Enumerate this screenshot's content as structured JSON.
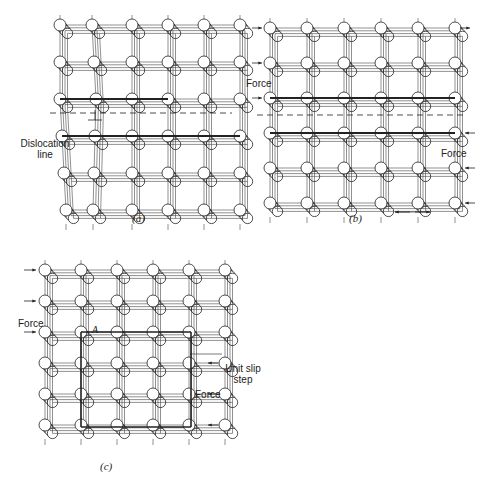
{
  "figure": {
    "panels": [
      {
        "id": "a",
        "caption": "(a)",
        "labels": {
          "dislocation": "Dislocation line"
        },
        "grid": {
          "cols": 6,
          "rows": 6,
          "origin": [
            60,
            25
          ],
          "dx": 36,
          "dy": 37
        }
      },
      {
        "id": "b",
        "caption": "(b)",
        "labels": {
          "force_left": "Force",
          "force_right": "Force",
          "dislocation_symbol": "⊥"
        },
        "grid": {
          "cols": 6,
          "rows": 6,
          "origin": [
            270,
            28
          ],
          "dx": 37,
          "dy": 35
        }
      },
      {
        "id": "c",
        "caption": "(c)",
        "labels": {
          "force_left": "Force",
          "force_right": "Force",
          "point": "A",
          "slip": "Unit slip step"
        },
        "grid": {
          "cols": 6,
          "rows": 6,
          "origin": [
            45,
            270
          ],
          "dx": 36,
          "dy": 31
        }
      }
    ],
    "colors": {
      "ink": "#222222",
      "atom_fill": "#ffffff",
      "background": "#ffffff"
    }
  }
}
